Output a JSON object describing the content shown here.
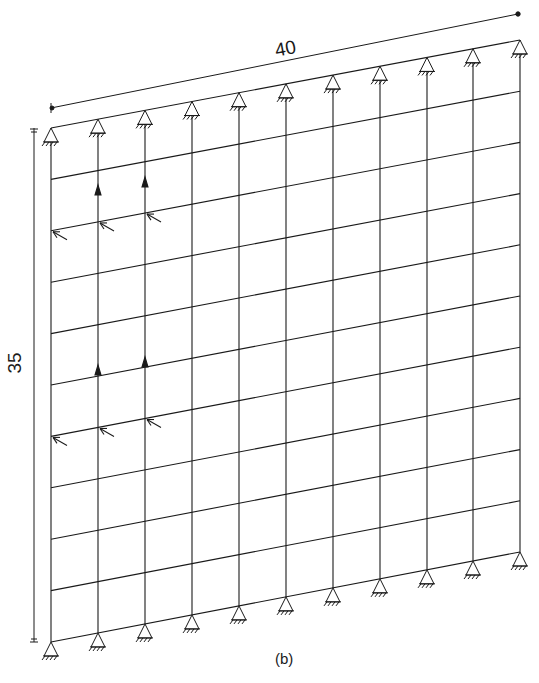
{
  "figure": {
    "caption": "(b)",
    "dimension_width_label": "40",
    "dimension_height_label": "35",
    "stroke_color": "#1a1a1a",
    "background_color": "#ffffff"
  },
  "grid": {
    "columns": 11,
    "rows": 11,
    "bays_horizontal": 10,
    "bays_vertical": 10,
    "column_x": [
      51,
      98,
      145,
      192,
      239,
      286,
      333,
      380,
      427,
      473,
      520
    ],
    "top_left": [
      51,
      128
    ],
    "top_right": [
      520,
      40
    ],
    "bottom_left": [
      51,
      642
    ],
    "bottom_right": [
      520,
      552
    ]
  },
  "supports": {
    "type": "pin-support",
    "top_count": 11,
    "bottom_count": 11
  },
  "loads": {
    "vertical_up_arrows": [
      {
        "column": 1,
        "y": 195
      },
      {
        "column": 2,
        "y": 187
      },
      {
        "column": 1,
        "y": 375
      },
      {
        "column": 2,
        "y": 367
      }
    ],
    "diagonal_arrows": [
      {
        "column": 0,
        "row": 2
      },
      {
        "column": 1,
        "row": 2
      },
      {
        "column": 2,
        "row": 2
      },
      {
        "column": 0,
        "row": 6
      },
      {
        "column": 1,
        "row": 6
      },
      {
        "column": 2,
        "row": 6
      }
    ]
  }
}
